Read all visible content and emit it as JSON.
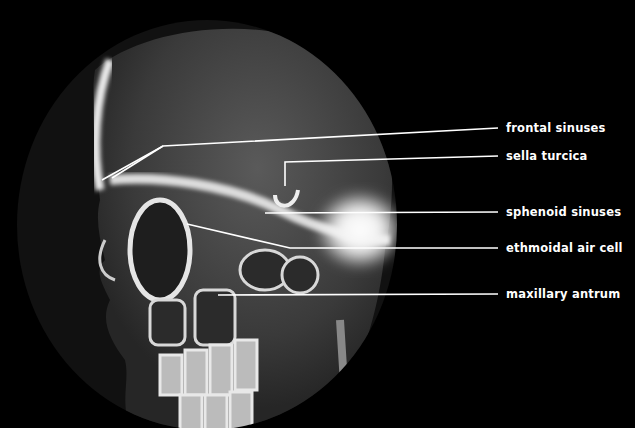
{
  "figure": {
    "background_color": "#000000",
    "line_color": "#ffffff"
  },
  "labels": [
    {
      "text": "frontal sinuses",
      "y": 128
    },
    {
      "text": "sella turcica",
      "y": 156
    },
    {
      "text": "sphenoid sinuses",
      "y": 212
    },
    {
      "text": "ethmoidal air cell",
      "y": 248
    },
    {
      "text": "maxillary antrum",
      "y": 294
    }
  ]
}
